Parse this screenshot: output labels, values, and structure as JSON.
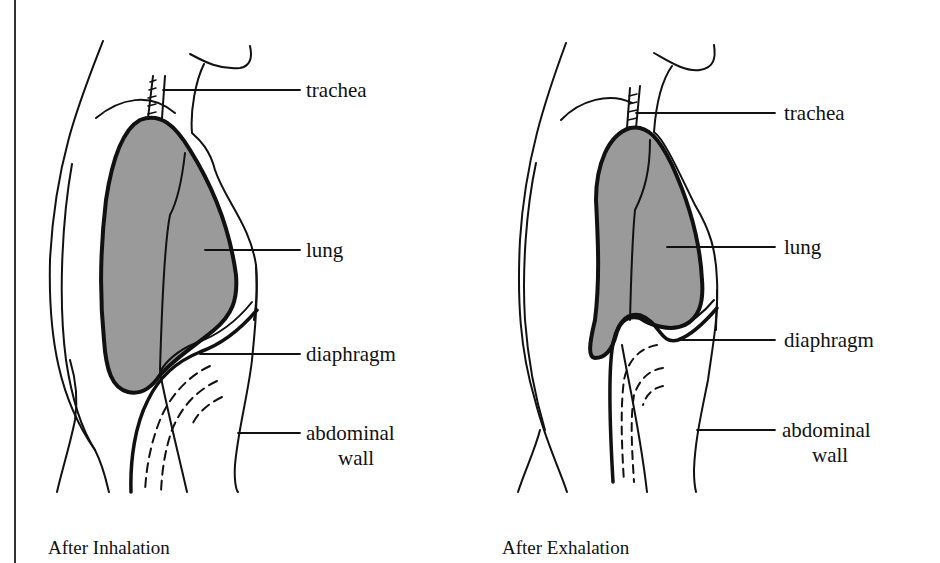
{
  "panels": [
    {
      "caption": "After Inhalation",
      "labels": {
        "trachea": "trachea",
        "lung": "lung",
        "diaphragm": "diaphragm",
        "abdominal_wall_line1": "abdominal",
        "abdominal_wall_line2": "wall"
      }
    },
    {
      "caption": "After Exhalation",
      "labels": {
        "trachea": "trachea",
        "lung": "lung",
        "diaphragm": "diaphragm",
        "abdominal_wall_line1": "abdominal",
        "abdominal_wall_line2": "wall"
      }
    }
  ],
  "colors": {
    "lung_fill": "#9a9a9a",
    "ink": "#111111",
    "background": "#ffffff"
  }
}
